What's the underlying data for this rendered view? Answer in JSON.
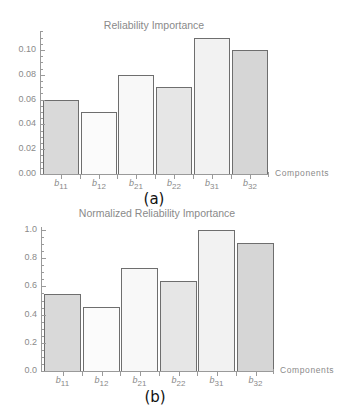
{
  "chart_data": [
    {
      "type": "bar",
      "title": "Reliability Importance",
      "caption": "(a)",
      "xlabel": "Components",
      "ylabel": "",
      "categories": [
        "b11",
        "b12",
        "b21",
        "b22",
        "b31",
        "b32"
      ],
      "category_labels": [
        {
          "base": "b",
          "sub": "11"
        },
        {
          "base": "b",
          "sub": "12"
        },
        {
          "base": "b",
          "sub": "21"
        },
        {
          "base": "b",
          "sub": "22"
        },
        {
          "base": "b",
          "sub": "31"
        },
        {
          "base": "b",
          "sub": "32"
        }
      ],
      "values": [
        0.06,
        0.05,
        0.08,
        0.07,
        0.11,
        0.1
      ],
      "bar_colors": [
        "#d9d9d9",
        "#fbfbfb",
        "#f8f8f8",
        "#e6e6e6",
        "#f2f2f2",
        "#d6d6d6"
      ],
      "yticks": [
        "0.00",
        "0.02",
        "0.04",
        "0.06",
        "0.08",
        "0.10"
      ],
      "ytick_values": [
        0,
        0.02,
        0.04,
        0.06,
        0.08,
        0.1
      ],
      "ylim": [
        0,
        0.114
      ],
      "grid": false,
      "legend": null
    },
    {
      "type": "bar",
      "title": "Normalized Reliability Importance",
      "caption": "(b)",
      "xlabel": "Components",
      "ylabel": "",
      "categories": [
        "b11",
        "b12",
        "b21",
        "b22",
        "b31",
        "b32"
      ],
      "category_labels": [
        {
          "base": "b",
          "sub": "11"
        },
        {
          "base": "b",
          "sub": "12"
        },
        {
          "base": "b",
          "sub": "21"
        },
        {
          "base": "b",
          "sub": "22"
        },
        {
          "base": "b",
          "sub": "31"
        },
        {
          "base": "b",
          "sub": "32"
        }
      ],
      "values": [
        0.545,
        0.455,
        0.727,
        0.636,
        1.0,
        0.909
      ],
      "bar_colors": [
        "#d9d9d9",
        "#fbfbfb",
        "#f8f8f8",
        "#e6e6e6",
        "#f2f2f2",
        "#d6d6d6"
      ],
      "yticks": [
        "0.0",
        "0.2",
        "0.4",
        "0.6",
        "0.8",
        "1.0"
      ],
      "ytick_values": [
        0,
        0.2,
        0.4,
        0.6,
        0.8,
        1.0
      ],
      "ylim": [
        0,
        1.02
      ],
      "grid": false,
      "legend": null
    }
  ],
  "layout": [
    {
      "axis_x": 40,
      "y0": 174,
      "px_per_unit": 1240,
      "axis_top": 31,
      "axis_right": 268,
      "bar_lefts": [
        43,
        81,
        118,
        156,
        194,
        232
      ],
      "bar_width": 36,
      "title_x": 154,
      "title_y": 19,
      "caption_x": 154,
      "caption_y": 190,
      "xtitle_x": 275,
      "minor_step": 0.005
    },
    {
      "axis_x": 41,
      "y0": 371,
      "px_per_unit": 141,
      "axis_top": 227,
      "axis_right": 273,
      "bar_lefts": [
        44,
        83,
        121,
        160,
        198,
        237
      ],
      "bar_width": 37,
      "title_x": 157,
      "title_y": 207,
      "caption_x": 155,
      "caption_y": 388,
      "xtitle_x": 280,
      "minor_step": 0.05
    }
  ]
}
